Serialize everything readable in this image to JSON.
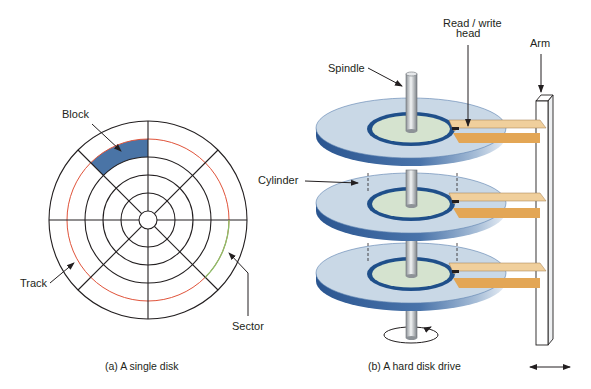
{
  "figure": {
    "panel_a": {
      "caption": "(a) A single disk",
      "labels": {
        "block": "Block",
        "track": "Track",
        "sector": "Sector"
      },
      "disk": {
        "ring_count": 5,
        "sector_count": 8,
        "highlighted_track_color": "#e0533a",
        "highlighted_sector_color": "#8bbf6a",
        "block_fill_color": "#4a74a6"
      }
    },
    "panel_b": {
      "caption": "(b) A hard disk drive",
      "labels": {
        "spindle": "Spindle",
        "read_write_head_line1": "Read / write",
        "read_write_head_line2": "head",
        "arm": "Arm",
        "cylinder": "Cylinder"
      },
      "platter_count": 3,
      "colors": {
        "platter_surface": "#c9d8e6",
        "platter_edge": "#2f5d99",
        "hub_fill": "#d5e3cf",
        "hub_ring": "#1f4f8a",
        "head_top": "#f0cf9c",
        "head_bottom": "#e3a655",
        "spindle": "#b8bdc2",
        "arm": "#ffffff"
      }
    }
  }
}
